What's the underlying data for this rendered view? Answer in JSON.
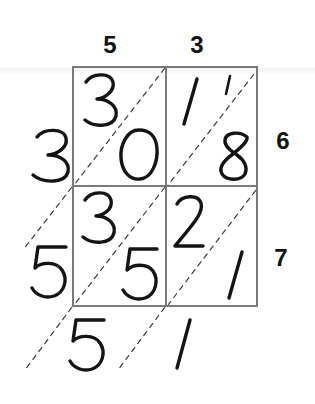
{
  "title": "Lattice multiplication: 53 × 67 = 3551",
  "problem": {
    "top_factor_digits": [
      "5",
      "3"
    ],
    "right_factor_digits": [
      "6",
      "7"
    ],
    "top_factor": "53",
    "right_factor": "67",
    "product": "3551"
  },
  "cells": [
    {
      "row": 0,
      "col": 0,
      "tens": "3",
      "ones": "0",
      "carry": ""
    },
    {
      "row": 0,
      "col": 1,
      "tens": "1",
      "ones": "8",
      "carry": "1"
    },
    {
      "row": 1,
      "col": 0,
      "tens": "3",
      "ones": "5",
      "carry": ""
    },
    {
      "row": 1,
      "col": 1,
      "tens": "2",
      "ones": "1",
      "carry": ""
    }
  ],
  "result_digits": {
    "left": [
      "3",
      "5"
    ],
    "bottom": [
      "5",
      "1"
    ]
  },
  "colors": {
    "grid": "#7a7a7a",
    "ink": "#141414",
    "background": "#ffffff"
  }
}
